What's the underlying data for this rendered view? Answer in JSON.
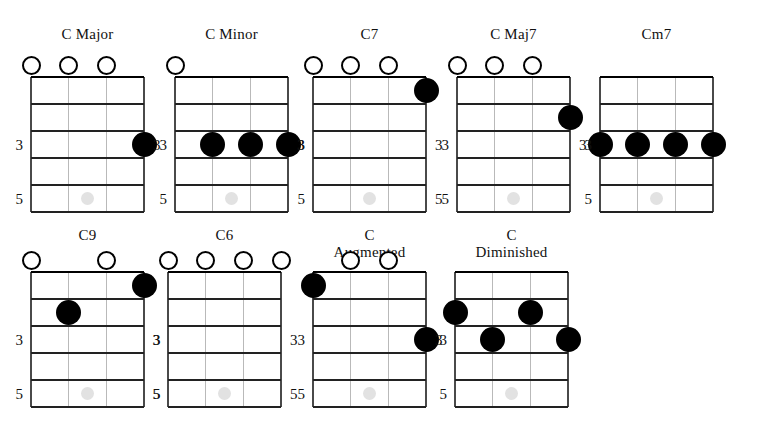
{
  "page": {
    "instrument": "ukulele",
    "string_count": 4,
    "fret_count": 5,
    "fret_labels": [
      "3",
      "5"
    ],
    "open_marker": "open-string-circle",
    "dot_marker": "fingering-dot",
    "inlay_marker": "fret-inlay-dot",
    "colors": {
      "dot": "#000000",
      "line": "#222222",
      "nut": "#000000",
      "string": "#b9b9b9",
      "inlay": "#e2e2e2",
      "text": "#111111",
      "background": "#ffffff"
    }
  },
  "chart_data": {
    "type": "table",
    "columns": [
      "chord",
      "open_strings",
      "fingerings"
    ],
    "chords": [
      {
        "id": "c-major",
        "name": "C Major",
        "title_lines": [
          "C Major"
        ],
        "open": [
          1,
          2,
          3
        ],
        "dots": [
          {
            "string": 4,
            "fret": 3
          }
        ],
        "fret_labels_left": [
          "3",
          "5"
        ],
        "fret_labels_right": [
          "3"
        ]
      },
      {
        "id": "c-minor",
        "name": "C Minor",
        "title_lines": [
          "C Minor"
        ],
        "open": [
          1
        ],
        "dots": [
          {
            "string": 2,
            "fret": 3
          },
          {
            "string": 3,
            "fret": 3
          },
          {
            "string": 4,
            "fret": 3
          }
        ],
        "fret_labels_left": [
          "3",
          "5"
        ],
        "fret_labels_right": [
          "3"
        ]
      },
      {
        "id": "c7",
        "name": "C7",
        "title_lines": [
          "C7"
        ],
        "open": [
          1,
          2,
          3
        ],
        "dots": [
          {
            "string": 4,
            "fret": 1
          }
        ],
        "fret_labels_left": [
          "3",
          "5"
        ],
        "fret_labels_right": [
          "3",
          "5"
        ]
      },
      {
        "id": "c-maj7",
        "name": "C Maj7",
        "title_lines": [
          "C Maj7"
        ],
        "open": [
          1,
          2,
          3
        ],
        "dots": [
          {
            "string": 4,
            "fret": 2
          }
        ],
        "fret_labels_left": [
          "3",
          "5"
        ],
        "fret_labels_right": [
          "3"
        ]
      },
      {
        "id": "cm7",
        "name": "Cm7",
        "title_lines": [
          "Cm7"
        ],
        "open": [],
        "dots": [
          {
            "string": 1,
            "fret": 3
          },
          {
            "string": 2,
            "fret": 3
          },
          {
            "string": 3,
            "fret": 3
          },
          {
            "string": 4,
            "fret": 3
          }
        ],
        "fret_labels_left": [
          "3",
          "5"
        ],
        "fret_labels_right": []
      },
      {
        "id": "c9",
        "name": "C9",
        "title_lines": [
          "C9"
        ],
        "open": [
          1,
          3
        ],
        "dots": [
          {
            "string": 2,
            "fret": 2
          },
          {
            "string": 4,
            "fret": 1
          }
        ],
        "fret_labels_left": [
          "3",
          "5"
        ],
        "fret_labels_right": [
          "3",
          "5"
        ]
      },
      {
        "id": "c6",
        "name": "C6",
        "title_lines": [
          "C6"
        ],
        "open": [
          1,
          2,
          3,
          4
        ],
        "dots": [],
        "fret_labels_left": [
          "3",
          "5"
        ],
        "fret_labels_right": [
          "3",
          "5"
        ]
      },
      {
        "id": "c-augmented",
        "name": "C Augmented",
        "title_lines": [
          "C",
          "Augmented"
        ],
        "open": [
          2,
          3
        ],
        "dots": [
          {
            "string": 1,
            "fret": 1
          },
          {
            "string": 4,
            "fret": 3
          }
        ],
        "fret_labels_left": [
          "3",
          "5"
        ],
        "fret_labels_right": [
          "3"
        ]
      },
      {
        "id": "c-diminished",
        "name": "C Diminished",
        "title_lines": [
          "C",
          "Diminished"
        ],
        "open": [],
        "dots": [
          {
            "string": 1,
            "fret": 2
          },
          {
            "string": 2,
            "fret": 3
          },
          {
            "string": 3,
            "fret": 2
          },
          {
            "string": 4,
            "fret": 3
          }
        ],
        "fret_labels_left": [
          "3",
          "5"
        ],
        "fret_labels_right": []
      }
    ]
  }
}
